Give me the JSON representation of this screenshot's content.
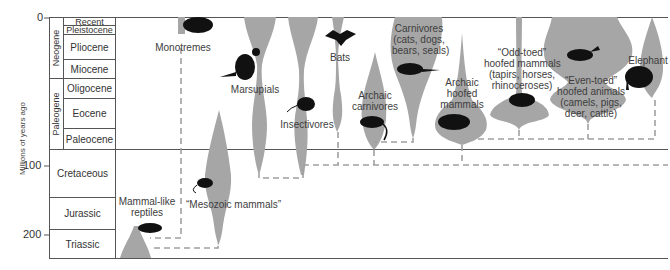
{
  "axis": {
    "title": "Millions of years ago",
    "ticks": [
      "0",
      "100",
      "200"
    ]
  },
  "eras": [
    {
      "name": "Neogene"
    },
    {
      "name": "Paleogene"
    }
  ],
  "periods": [
    {
      "name": "Recent"
    },
    {
      "name": "Pleistocene"
    },
    {
      "name": "Pliocene"
    },
    {
      "name": "Miocene"
    },
    {
      "name": "Oligocene"
    },
    {
      "name": "Eocene"
    },
    {
      "name": "Paleocene"
    },
    {
      "name": "Cretaceous"
    },
    {
      "name": "Jurassic"
    },
    {
      "name": "Triassic"
    }
  ],
  "groups": {
    "mammal_like_reptiles": {
      "line1": "Mammal-like",
      "line2": "reptiles"
    },
    "monotremes": {
      "line1": "Monotremes"
    },
    "mesozoic_mammals": {
      "line1": "“Mesozoic mammals”"
    },
    "marsupials": {
      "line1": "Marsupials"
    },
    "insectivores": {
      "line1": "Insectivores"
    },
    "bats": {
      "line1": "Bats"
    },
    "archaic_carnivores": {
      "line1": "Archaic",
      "line2": "carnivores"
    },
    "carnivores": {
      "line1": "Carnivores",
      "line2": "(cats, dogs,",
      "line3": "bears, seals)"
    },
    "archaic_hoofed": {
      "line1": "Archaic",
      "line2": "hoofed",
      "line3": "mammals"
    },
    "odd_toed": {
      "line1": "“Odd-toed”",
      "line2": "hoofed mammals",
      "line3": "(tapirs, horses,",
      "line4": "rhinoceroses)"
    },
    "even_toed": {
      "line1": "“Even-toed”",
      "line2": "hoofed animals",
      "line3": "(camels, pigs,",
      "line4": "deer, cattle)"
    },
    "elephant": {
      "line1": "Elephant"
    }
  },
  "colors": {
    "branch_fill": "#a6a6a6",
    "dash": "#a0a0a0",
    "silhouette": "#111111",
    "rule": "#555555"
  }
}
